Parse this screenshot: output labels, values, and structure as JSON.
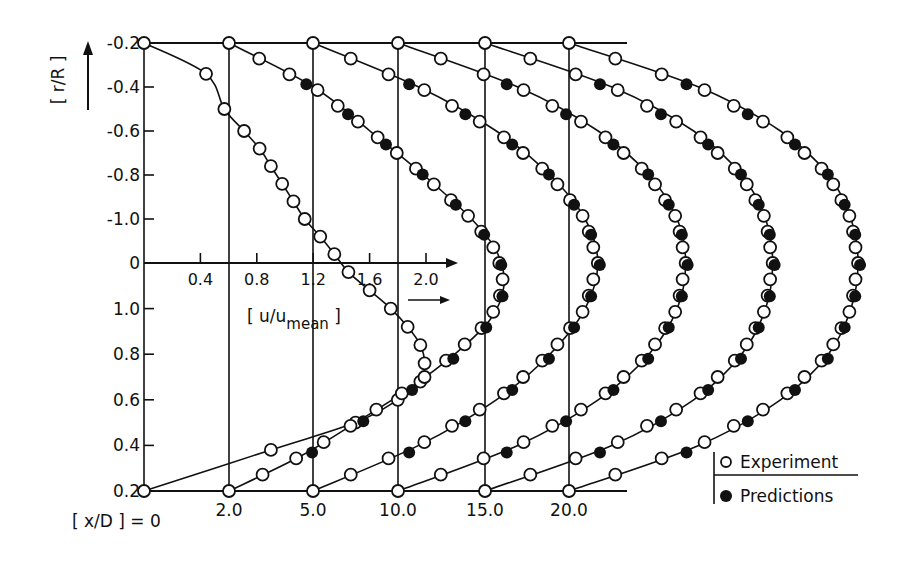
{
  "chart_data": {
    "type": "line",
    "title": "",
    "ylabel": "[ r/R ]",
    "xlabel": "[ u/umean ]",
    "xlabel_main": "[ u/u",
    "xlabel_sub": "mean",
    "xlabel_close": " ]",
    "station_label_prefix": "[ x/D ] = 0",
    "y_tick_labels_top": [
      "-0.2",
      "-0.4",
      "-0.6",
      "-0.8",
      "-1.0"
    ],
    "y_tick_label_center": "0",
    "y_tick_labels_bottom": [
      "1.0",
      "0.8",
      "0.6",
      "0.4",
      "0.2"
    ],
    "u_ticks": [
      0.4,
      0.8,
      1.2,
      1.6,
      2.0
    ],
    "u_tick_labels": [
      "0.4",
      "0.8",
      "1.2",
      "1.6",
      "2.0"
    ],
    "stations": [
      {
        "xD": 0,
        "label": "[ x/D ] = 0"
      },
      {
        "xD": 2.0,
        "label": "2.0"
      },
      {
        "xD": 5.0,
        "label": "5.0"
      },
      {
        "xD": 10.0,
        "label": "10.0"
      },
      {
        "xD": 15.0,
        "label": "15.0"
      },
      {
        "xD": 20.0,
        "label": "20.0"
      }
    ],
    "legend": {
      "position": "bottom-right",
      "items": [
        {
          "label": "Experiment",
          "marker": "open-circle"
        },
        {
          "label": "Predictions",
          "marker": "filled-circle"
        }
      ]
    },
    "series": [
      {
        "name": "x/D=0",
        "r": [
          -1.0,
          -0.86,
          -0.7,
          -0.6,
          -0.52,
          -0.44,
          -0.36,
          -0.28,
          -0.2,
          -0.12,
          -0.04,
          0.04,
          0.12,
          0.2,
          0.28,
          0.36,
          0.44,
          0.52,
          0.6,
          0.7,
          0.82,
          1.0
        ],
        "u": [
          0.0,
          0.44,
          0.57,
          0.71,
          0.82,
          0.9,
          0.98,
          1.06,
          1.14,
          1.25,
          1.35,
          1.45,
          1.6,
          1.75,
          1.87,
          1.96,
          1.99,
          1.96,
          1.8,
          1.5,
          0.9,
          0.0
        ],
        "experiment": true,
        "prediction_idx": []
      },
      {
        "name": "x/D=2.0",
        "r": [
          -1.0,
          -0.8,
          -0.6,
          -0.4,
          -0.2,
          -0.05,
          0.1,
          0.25,
          0.4,
          0.55,
          0.7,
          0.85,
          1.0
        ],
        "u": [
          0.0,
          0.6,
          1.0,
          1.38,
          1.72,
          1.9,
          1.95,
          1.85,
          1.6,
          1.28,
          0.9,
          0.5,
          0.0
        ],
        "prediction_idx": [
          1,
          3,
          5,
          7,
          9
        ]
      },
      {
        "name": "x/D=5.0",
        "r": [
          -1.0,
          -0.8,
          -0.6,
          -0.4,
          -0.2,
          0.0,
          0.2,
          0.4,
          0.6,
          0.8,
          1.0
        ],
        "u": [
          0.0,
          0.75,
          1.3,
          1.68,
          1.93,
          2.02,
          1.93,
          1.68,
          1.3,
          0.75,
          0.0
        ],
        "prediction_idx": [
          1,
          3,
          5,
          7,
          9
        ]
      },
      {
        "name": "x/D=10.0",
        "r": [
          -1.0,
          -0.8,
          -0.6,
          -0.4,
          -0.2,
          0.0,
          0.2,
          0.4,
          0.6,
          0.8,
          1.0
        ],
        "u": [
          0.0,
          0.85,
          1.42,
          1.78,
          1.98,
          2.04,
          1.98,
          1.78,
          1.42,
          0.85,
          0.0
        ],
        "prediction_idx": [
          1,
          3,
          5,
          7,
          9
        ]
      },
      {
        "name": "x/D=15.0",
        "r": [
          -1.0,
          -0.8,
          -0.6,
          -0.4,
          -0.2,
          0.0,
          0.2,
          0.4,
          0.6,
          0.8,
          1.0
        ],
        "u": [
          0.0,
          0.9,
          1.48,
          1.82,
          1.99,
          2.04,
          1.99,
          1.82,
          1.48,
          0.9,
          0.0
        ],
        "prediction_idx": [
          1,
          3,
          5,
          7,
          9
        ]
      },
      {
        "name": "x/D=20.0",
        "r": [
          -1.0,
          -0.8,
          -0.6,
          -0.4,
          -0.2,
          0.0,
          0.2,
          0.4,
          0.6,
          0.8,
          1.0
        ],
        "u": [
          0.0,
          0.92,
          1.5,
          1.84,
          2.0,
          2.05,
          2.0,
          1.84,
          1.5,
          0.92,
          0.0
        ],
        "prediction_idx": [
          1,
          3,
          5,
          7,
          9
        ]
      }
    ]
  }
}
